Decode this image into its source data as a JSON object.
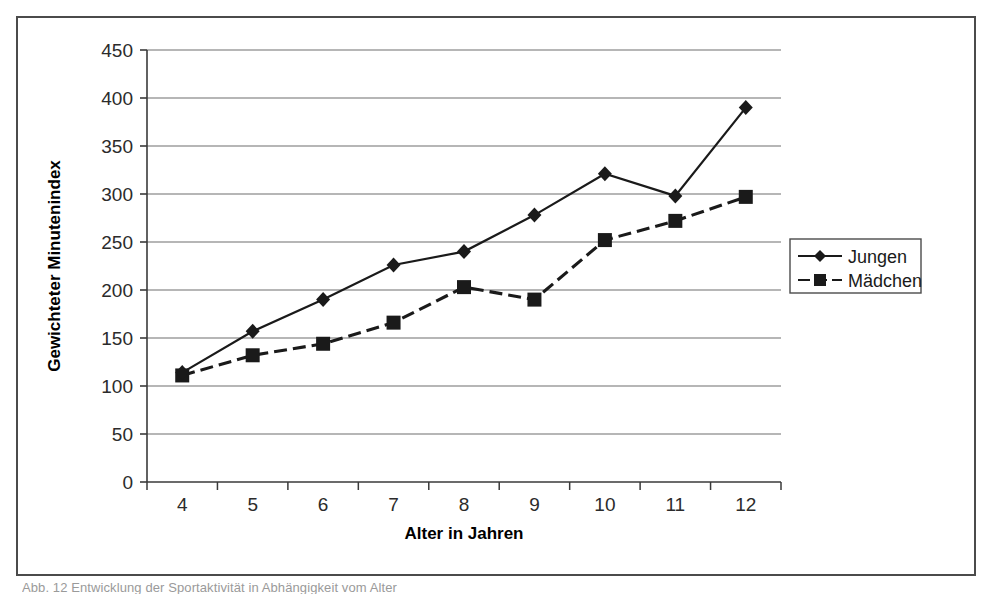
{
  "chart_data": {
    "type": "line",
    "title": "",
    "xlabel": "Alter in Jahren",
    "ylabel": "Gewichteter Minutenindex",
    "categories": [
      4,
      5,
      6,
      7,
      8,
      9,
      10,
      11,
      12
    ],
    "x_tick_labels": [
      "4",
      "5",
      "6",
      "7",
      "8",
      "9",
      "10",
      "11",
      "12"
    ],
    "y_tick_labels": [
      "0",
      "50",
      "100",
      "150",
      "200",
      "250",
      "300",
      "350",
      "400",
      "450"
    ],
    "ylim": [
      0,
      450
    ],
    "y_tick_step": 50,
    "grid": "horizontal",
    "legend_position": "right",
    "series": [
      {
        "name": "Jungen",
        "marker": "diamond",
        "line_style": "solid",
        "color": "#1a1a1a",
        "values": [
          114,
          157,
          190,
          226,
          240,
          278,
          321,
          298,
          390
        ]
      },
      {
        "name": "Mädchen",
        "marker": "square",
        "line_style": "dashed",
        "color": "#1a1a1a",
        "values": [
          111,
          132,
          144,
          166,
          203,
          190,
          252,
          272,
          297
        ]
      }
    ]
  },
  "legend": {
    "entries": [
      {
        "label": "Jungen"
      },
      {
        "label": "Mädchen"
      }
    ]
  },
  "caption": {
    "text": "Abb. 12 Entwicklung der Sportaktivität in Abhängigkeit vom Alter"
  }
}
